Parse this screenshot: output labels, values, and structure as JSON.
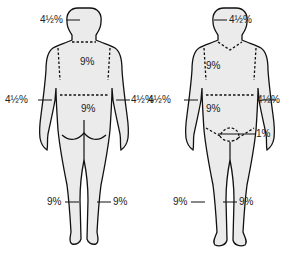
{
  "figures": [
    {
      "view": "posterior",
      "labels": {
        "head": "4½%",
        "upper_back": "9%",
        "lower_back": "9%",
        "left_arm": "4½%",
        "right_arm": "4½%",
        "left_leg": "9%",
        "right_leg": "9%"
      }
    },
    {
      "view": "anterior",
      "labels": {
        "head": "4½%",
        "chest": "9%",
        "abdomen": "9%",
        "left_arm": "4½%",
        "right_arm": "4½%",
        "genitals": "1%",
        "left_leg": "9%",
        "right_leg": "9%"
      }
    }
  ]
}
